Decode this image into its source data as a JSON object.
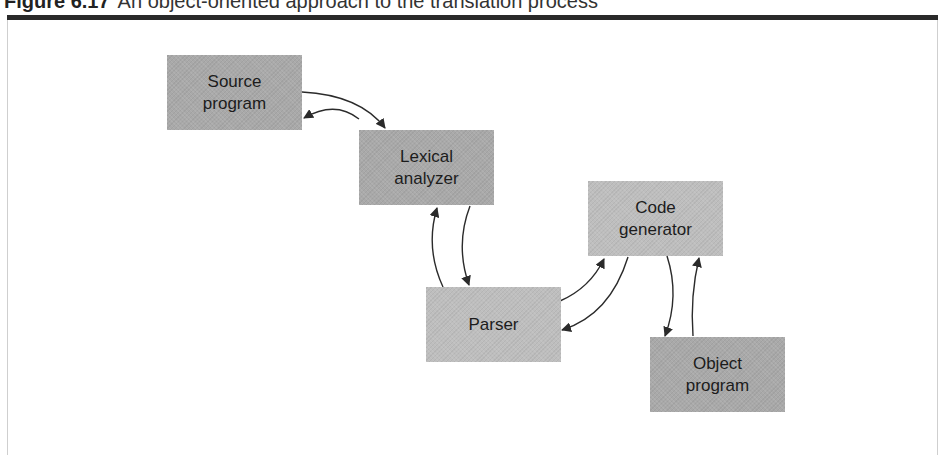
{
  "caption": {
    "figure_number": "Figure 6.17",
    "title": "An object-oriented approach to the translation process"
  },
  "colors": {
    "top_bar": "#2a2a2a",
    "node_dark": "#a9a9a9",
    "node_light": "#bebebe",
    "arrow": "#2b2b2b"
  },
  "nodes": {
    "source_program": {
      "line1": "Source",
      "line2": "program"
    },
    "lexical_analyzer": {
      "line1": "Lexical",
      "line2": "analyzer"
    },
    "parser": {
      "line1": "Parser"
    },
    "code_generator": {
      "line1": "Code",
      "line2": "generator"
    },
    "object_program": {
      "line1": "Object",
      "line2": "program"
    }
  },
  "edges": [
    {
      "from": "Source program",
      "to": "Lexical analyzer"
    },
    {
      "from": "Lexical analyzer",
      "to": "Source program"
    },
    {
      "from": "Lexical analyzer",
      "to": "Parser"
    },
    {
      "from": "Parser",
      "to": "Lexical analyzer"
    },
    {
      "from": "Parser",
      "to": "Code generator"
    },
    {
      "from": "Code generator",
      "to": "Parser"
    },
    {
      "from": "Code generator",
      "to": "Object program"
    },
    {
      "from": "Object program",
      "to": "Code generator"
    }
  ]
}
